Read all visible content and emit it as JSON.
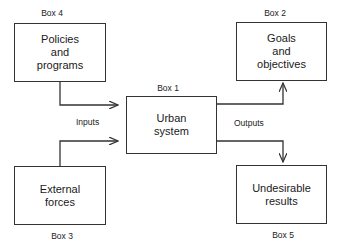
{
  "diagram": {
    "colors": {
      "stroke": "#333333",
      "background": "#ffffff",
      "text": "#1a1a1a"
    },
    "boxes": [
      {
        "id": "box1",
        "label": "Box 1",
        "text": "Urban\nsystem"
      },
      {
        "id": "box2",
        "label": "Box 2",
        "text": "Goals\nand\nobjectives"
      },
      {
        "id": "box3",
        "label": "Box 3",
        "text": "External\nforces"
      },
      {
        "id": "box4",
        "label": "Box 4",
        "text": "Policies\nand\nprograms"
      },
      {
        "id": "box5",
        "label": "Box 5",
        "text": "Undesirable\nresults"
      }
    ],
    "flow_labels": {
      "inputs": "Inputs",
      "outputs": "Outputs"
    },
    "edges": [
      {
        "from": "Box 4",
        "to": "Box 1",
        "group": "Inputs"
      },
      {
        "from": "Box 3",
        "to": "Box 1",
        "group": "Inputs"
      },
      {
        "from": "Box 1",
        "to": "Box 2",
        "group": "Outputs"
      },
      {
        "from": "Box 1",
        "to": "Box 5",
        "group": "Outputs"
      }
    ]
  }
}
